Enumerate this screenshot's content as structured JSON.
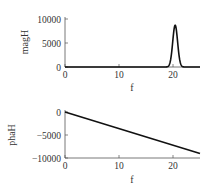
{
  "chart_data": [
    {
      "type": "line",
      "title": "",
      "xlabel": "f",
      "ylabel": "magH",
      "xlim": [
        0,
        25
      ],
      "ylim": [
        0,
        10000
      ],
      "xticks": [
        0,
        10,
        20
      ],
      "xtick_labels": [
        "0",
        "10",
        "20"
      ],
      "yticks": [
        0,
        5000,
        10000
      ],
      "ytick_labels": [
        "0",
        "5000",
        "10000"
      ],
      "grid": false,
      "series": [
        {
          "name": "magH",
          "peak": {
            "f": 20.4,
            "value": 8700,
            "width_sigma": 0.45
          },
          "x": [
            0,
            5,
            10,
            15,
            18.5,
            19.0,
            19.5,
            19.8,
            20.1,
            20.4,
            20.7,
            21.0,
            21.3,
            21.6,
            22.0,
            22.5,
            25
          ],
          "y": [
            0,
            0,
            0,
            0,
            0,
            100,
            1100,
            3300,
            6800,
            8700,
            6800,
            3300,
            1100,
            250,
            0,
            0,
            0
          ]
        }
      ]
    },
    {
      "type": "line",
      "title": "",
      "xlabel": "f",
      "ylabel": "phaH",
      "xlim": [
        0,
        25
      ],
      "ylim": [
        -10000,
        0
      ],
      "xticks": [
        0,
        10,
        20
      ],
      "xtick_labels": [
        "0",
        "10",
        "20"
      ],
      "yticks": [
        -10000,
        -5000,
        0
      ],
      "ytick_labels": [
        "−10000",
        "−5000",
        "0"
      ],
      "grid": false,
      "series": [
        {
          "name": "phaH",
          "x": [
            0,
            25
          ],
          "y": [
            0,
            -9000
          ]
        }
      ]
    }
  ]
}
